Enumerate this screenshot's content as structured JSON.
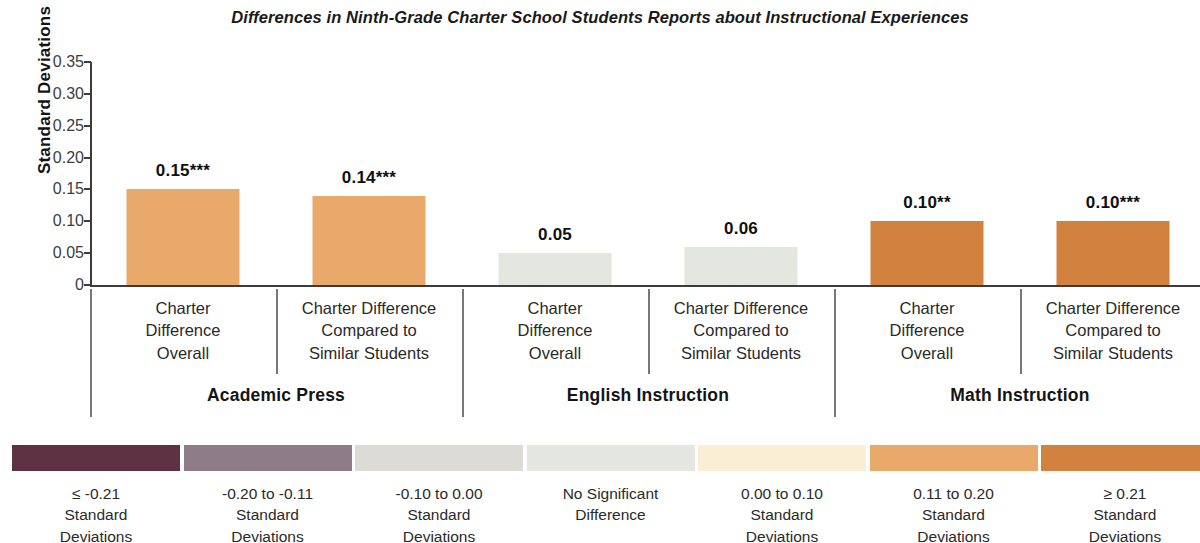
{
  "chart_data": {
    "type": "bar",
    "title": "Differences in Ninth-Grade Charter School Students Reports about Instructional Experiences",
    "xlabel": "",
    "ylabel": "Standard Deviations",
    "ylim": [
      0,
      0.35
    ],
    "ytick_labels": [
      "0.35",
      "0.30",
      "0.25",
      "0.20",
      "0.15",
      "0.10",
      "0.05",
      "0"
    ],
    "ytick_values": [
      0.35,
      0.3,
      0.25,
      0.2,
      0.15,
      0.1,
      0.05,
      0
    ],
    "grid": false,
    "legend_position": "bottom",
    "groups": [
      "Academic Press",
      "English Instruction",
      "Math Instruction"
    ],
    "categories": [
      "Charter Difference Overall",
      "Charter Difference Compared to Similar Students",
      "Charter Difference Overall",
      "Charter Difference Compared to Similar Students",
      "Charter Difference Overall",
      "Charter Difference Compared to Similar Students"
    ],
    "values": [
      0.15,
      0.14,
      0.05,
      0.06,
      0.1,
      0.1
    ],
    "data_labels": [
      "0.15***",
      "0.14***",
      "0.05",
      "0.06",
      "0.10**",
      "0.10***"
    ],
    "bar_colors": [
      "#E8A96A",
      "#E8A96A",
      "#E3E7E0",
      "#E3E7E0",
      "#D2813E",
      "#D2813E"
    ]
  },
  "title": "Differences in Ninth-Grade Charter School Students Reports about Instructional Experiences",
  "axis": {
    "y_label": "Standard Deviations",
    "y_ticks": [
      {
        "label": "0.35",
        "value": 0.35
      },
      {
        "label": "0.30",
        "value": 0.3
      },
      {
        "label": "0.25",
        "value": 0.25
      },
      {
        "label": "0.20",
        "value": 0.2
      },
      {
        "label": "0.15",
        "value": 0.15
      },
      {
        "label": "0.10",
        "value": 0.1
      },
      {
        "label": "0.05",
        "value": 0.05
      },
      {
        "label": "0",
        "value": 0
      }
    ]
  },
  "bars": [
    {
      "label": "0.15***",
      "value": 0.15,
      "color": "#E8A96A",
      "category": "Charter Difference Overall"
    },
    {
      "label": "0.14***",
      "value": 0.14,
      "color": "#E8A96A",
      "category": "Charter Difference Compared to Similar Students"
    },
    {
      "label": "0.05",
      "value": 0.05,
      "color": "#E3E7E0",
      "category": "Charter Difference Overall"
    },
    {
      "label": "0.06",
      "value": 0.06,
      "color": "#E3E7E0",
      "category": "Charter Difference Compared to Similar Students"
    },
    {
      "label": "0.10**",
      "value": 0.1,
      "color": "#D2813E",
      "category": "Charter Difference Overall"
    },
    {
      "label": "0.10***",
      "value": 0.1,
      "color": "#D2813E",
      "category": "Charter Difference Compared to Similar Students"
    }
  ],
  "categories": [
    {
      "line1": "Charter",
      "line2": "Difference",
      "line3": "Overall"
    },
    {
      "line1": "Charter Difference",
      "line2": "Compared to",
      "line3": "Similar Students"
    },
    {
      "line1": "Charter",
      "line2": "Difference",
      "line3": "Overall"
    },
    {
      "line1": "Charter Difference",
      "line2": "Compared to",
      "line3": "Similar Students"
    },
    {
      "line1": "Charter",
      "line2": "Difference",
      "line3": "Overall"
    },
    {
      "line1": "Charter Difference",
      "line2": "Compared to",
      "line3": "Similar Students"
    }
  ],
  "groups": [
    {
      "label": "Academic Press"
    },
    {
      "label": "English Instruction"
    },
    {
      "label": "Math Instruction"
    }
  ],
  "legend": {
    "items": [
      {
        "color": "#5E3242",
        "line1": "≤ -0.21",
        "line2": "Standard",
        "line3": "Deviations"
      },
      {
        "color": "#8E7D86",
        "line1": "-0.20 to -0.11",
        "line2": "Standard",
        "line3": "Deviations"
      },
      {
        "color": "#DCDBD6",
        "line1": "-0.10 to 0.00",
        "line2": "Standard",
        "line3": "Deviations"
      },
      {
        "color": "#E3E7E0",
        "line1": "No Significant",
        "line2": "Difference",
        "line3": ""
      },
      {
        "color": "#FAEFD5",
        "line1": "0.00 to 0.10",
        "line2": "Standard",
        "line3": "Deviations"
      },
      {
        "color": "#E8A96A",
        "line1": "0.11 to 0.20",
        "line2": "Standard",
        "line3": "Deviations"
      },
      {
        "color": "#D2813E",
        "line1": "≥ 0.21",
        "line2": "Standard",
        "line3": "Deviations"
      }
    ]
  }
}
